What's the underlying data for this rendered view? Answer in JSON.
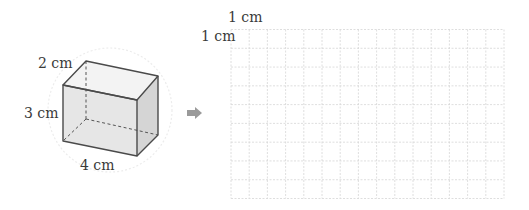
{
  "figure": {
    "cuboid": {
      "labels": {
        "depth": "2 cm",
        "height": "3 cm",
        "width": "4 cm"
      },
      "colors": {
        "edge": "#4a4a4a",
        "top_face": "#f3f3f3",
        "front_face": "#e6e6e6",
        "right_face": "#d5d5d5",
        "hidden_edge": "#555555"
      }
    },
    "arrow": {
      "icon": "right-arrow-icon",
      "color": "#9a9a9a"
    },
    "grid": {
      "columns": 15,
      "rows": 9,
      "unit_label_top": "1 cm",
      "unit_label_left": "1 cm",
      "line_color": "#d6d6d6"
    }
  }
}
